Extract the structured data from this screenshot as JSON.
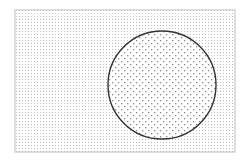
{
  "diagram": {
    "type": "venn-subset",
    "universe": {
      "shape": "rectangle",
      "x": 15,
      "y": 10,
      "width": 220,
      "height": 142,
      "fill_pattern": "fine-dots",
      "border_color": "#c8c8c8"
    },
    "subset": {
      "shape": "circle",
      "cx": 162,
      "cy": 85,
      "r": 54,
      "fill_pattern": "coarse-dots",
      "border_color": "#333333",
      "fill_color": "#ffffff"
    },
    "colors": {
      "fine_dot": "#bdbdbd",
      "coarse_dot": "#8a8a8a",
      "background": "#ffffff"
    }
  }
}
